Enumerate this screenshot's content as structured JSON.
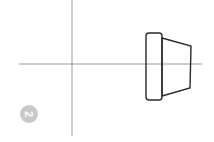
{
  "diagram": {
    "type": "technical-drawing-side-view",
    "badge": {
      "label": "2",
      "color": "#c8c8c8",
      "rotation_deg": 90
    },
    "axes": {
      "color": "#9a9a9a",
      "vertical": {
        "x": 72,
        "y1": 0,
        "y2": 136
      },
      "horizontal": {
        "y": 64,
        "x1": 19,
        "x2": 202
      }
    },
    "part": {
      "stroke": "#2a2a2a",
      "flange": {
        "x": 146,
        "y": 33,
        "width": 16,
        "height": 67,
        "radius": 3
      },
      "taper": {
        "points": [
          [
            162,
            38
          ],
          [
            191,
            46
          ],
          [
            190,
            88
          ],
          [
            162,
            96
          ]
        ]
      }
    }
  }
}
